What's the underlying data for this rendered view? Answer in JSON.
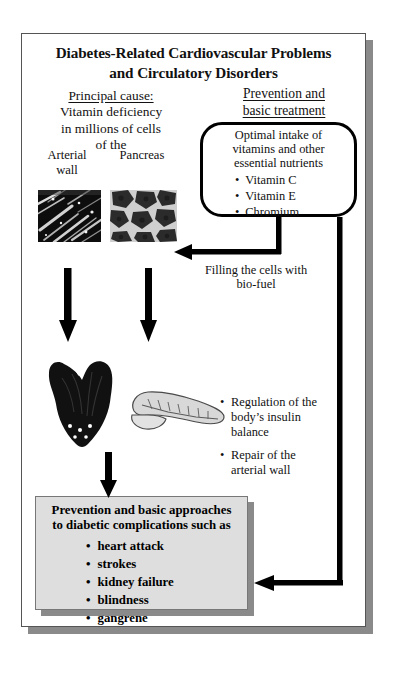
{
  "diagram": {
    "title_line1": "Diabetes-Related Cardiovascular Problems",
    "title_line2": "and Circulatory Disorders",
    "left_column": {
      "heading": "Principal cause:",
      "body_line1": "Vitamin deficiency",
      "body_line2": "in millions of cells",
      "body_line3": "of the",
      "caption_arterial_line1": "Arterial",
      "caption_arterial_line2": "wall",
      "caption_pancreas": "Pancreas",
      "image_arterial_name": "arterial-wall-micrograph",
      "image_pancreas_name": "pancreas-tissue-micrograph",
      "organ_heart_name": "heart-illustration",
      "organ_pancreas_name": "pancreas-organ-illustration"
    },
    "right_column": {
      "heading_line1": "Prevention and",
      "heading_line2": "basic treatment",
      "box_head_line1": "Optimal intake of",
      "box_head_line2": "vitamins and other",
      "box_head_line3": "essential nutrients",
      "box_items": [
        "Vitamin C",
        "Vitamin E",
        "Chromium"
      ]
    },
    "filling_caption_line1": "Filling the cells with",
    "filling_caption_line2": "bio-fuel",
    "mid_bullets": [
      "Regulation of the body’s insulin balance",
      "Repair of the arterial wall"
    ],
    "bottom_box": {
      "title_line1": "Prevention and basic approaches",
      "title_line2": "to diabetic complications such as",
      "items": [
        "heart attack",
        "strokes",
        "kidney failure",
        "blindness",
        "gangrene"
      ]
    },
    "colors": {
      "frame_border": "#555555",
      "shadow": "#8a8a8a",
      "grey_box_fill": "#dedede",
      "arrow": "#000000",
      "text": "#111111"
    }
  }
}
